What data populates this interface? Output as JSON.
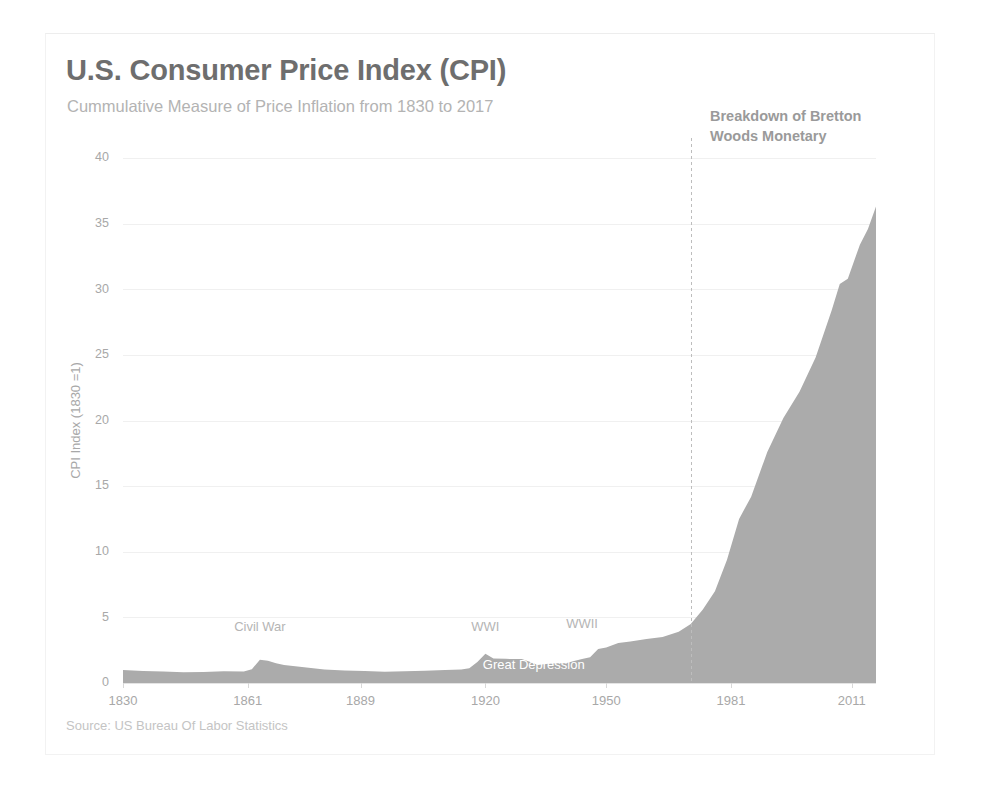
{
  "chart_data": {
    "type": "area",
    "title": "U.S. Consumer Price Index (CPI)",
    "subtitle": "Cummulative Measure of Price Inflation from 1830 to 2017",
    "xlabel": "",
    "ylabel": "CPI Index (1830 =1)",
    "source": "Source: US Bureau Of Labor Statistics",
    "xlim": [
      1830,
      2017
    ],
    "ylim": [
      0,
      40
    ],
    "y_ticks": [
      0,
      5,
      10,
      15,
      20,
      25,
      30,
      35,
      40
    ],
    "x_ticks": [
      1830,
      1861,
      1889,
      1920,
      1950,
      1981,
      2011
    ],
    "grid": true,
    "legend": "none",
    "series_name": "CPI Index (1830 = 1)",
    "fill_color": "#ababab",
    "x": [
      1830,
      1835,
      1840,
      1845,
      1850,
      1855,
      1860,
      1862,
      1864,
      1866,
      1868,
      1870,
      1875,
      1880,
      1885,
      1890,
      1895,
      1900,
      1905,
      1910,
      1914,
      1916,
      1918,
      1920,
      1922,
      1925,
      1929,
      1931,
      1933,
      1935,
      1938,
      1940,
      1942,
      1944,
      1946,
      1948,
      1950,
      1953,
      1956,
      1960,
      1964,
      1968,
      1971,
      1974,
      1977,
      1980,
      1983,
      1986,
      1990,
      1994,
      1998,
      2002,
      2006,
      2008,
      2010,
      2013,
      2015,
      2017
    ],
    "values": [
      1.0,
      0.92,
      0.88,
      0.82,
      0.84,
      0.9,
      0.88,
      1.05,
      1.78,
      1.7,
      1.5,
      1.38,
      1.2,
      1.02,
      0.95,
      0.92,
      0.86,
      0.9,
      0.94,
      1.0,
      1.02,
      1.12,
      1.6,
      2.22,
      1.86,
      1.84,
      1.82,
      1.62,
      1.38,
      1.44,
      1.5,
      1.5,
      1.68,
      1.82,
      1.96,
      2.6,
      2.7,
      3.04,
      3.16,
      3.36,
      3.5,
      3.9,
      4.5,
      5.6,
      7.0,
      9.4,
      12.5,
      14.2,
      17.6,
      20.2,
      22.2,
      24.8,
      28.4,
      30.4,
      30.8,
      33.4,
      34.6,
      36.3
    ],
    "annotations": [
      {
        "id": "civil-war",
        "label": "Civil War",
        "x_year": 1864,
        "y_value": 4.0,
        "style": "outside"
      },
      {
        "id": "wwi",
        "label": "WWI",
        "x_year": 1920,
        "y_value": 4.0,
        "style": "outside"
      },
      {
        "id": "wwii",
        "label": "WWII",
        "x_year": 1944,
        "y_value": 4.2,
        "style": "outside"
      },
      {
        "id": "great-depression",
        "label": "Great Depression",
        "x_year": 1932,
        "y_value": 1.1,
        "style": "inside"
      }
    ],
    "event_line": {
      "id": "bretton-woods",
      "x_year": 1971,
      "label_line_1": "Breakdown of Bretton",
      "label_line_2": "Woods Monetary"
    }
  }
}
